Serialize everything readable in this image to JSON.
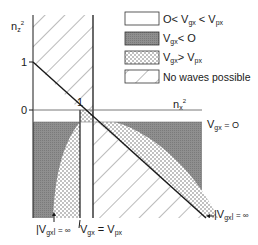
{
  "diagram": {
    "axes": {
      "y_label": "n",
      "y_label_sub": "z",
      "y_label_sup": "2",
      "x_label": "n",
      "x_label_sub": "x",
      "x_label_sup": "2",
      "y_tick_1": "1",
      "y_tick_0": "0",
      "point_label": "1"
    },
    "legend": [
      {
        "pattern": "white",
        "text_pre": "O< V",
        "sub1": "gx",
        "mid": " < V",
        "sub2": "px"
      },
      {
        "pattern": "gray",
        "text_pre": "V",
        "sub1": "gx",
        "mid": "< O",
        "sub2": ""
      },
      {
        "pattern": "dotted",
        "text_pre": "V",
        "sub1": "gx",
        "mid": "> V",
        "sub2": "px"
      },
      {
        "pattern": "hatched",
        "text_pre": "No waves possible",
        "sub1": "",
        "mid": "",
        "sub2": ""
      }
    ],
    "annotations": {
      "vgx_zero": {
        "pre": "V",
        "sub": "gx",
        "post": " = O"
      },
      "vgx_inf_right": {
        "pre": "|V",
        "sub": "gx",
        "post": "| = ∞"
      },
      "vgx_inf_bottom": {
        "pre": "|V",
        "sub": "gx",
        "post": "| = ∞"
      },
      "vgx_eq_vpx": {
        "pre": "V",
        "sub": "gx",
        "mid": " = V",
        "sub2": "px"
      }
    },
    "colors": {
      "line": "#1a1a1a",
      "gray_fill": "#8a8a8a",
      "dot": "#555555",
      "hatch": "#777777"
    }
  }
}
